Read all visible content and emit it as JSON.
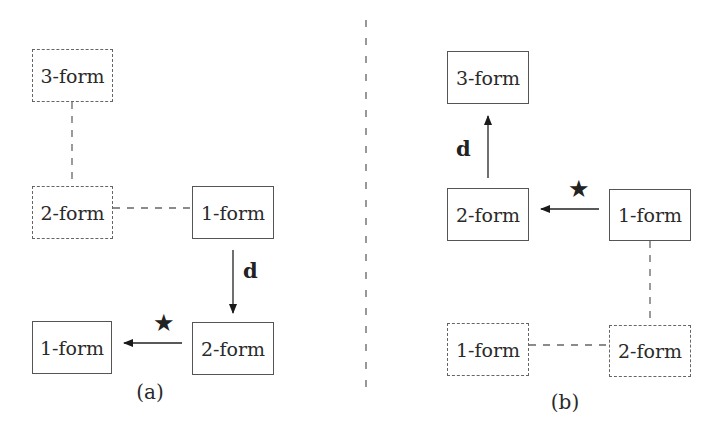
{
  "diagram": {
    "panels": [
      {
        "id": "a",
        "caption": "(a)",
        "nodes": [
          {
            "id": "a_3form",
            "label": "3-form",
            "style": "dashed"
          },
          {
            "id": "a_2form_top",
            "label": "2-form",
            "style": "dashed"
          },
          {
            "id": "a_1form_top",
            "label": "1-form",
            "style": "solid"
          },
          {
            "id": "a_2form_bottom",
            "label": "2-form",
            "style": "solid"
          },
          {
            "id": "a_1form_bottom",
            "label": "1-form",
            "style": "solid"
          }
        ],
        "edges": [
          {
            "from": "a_3form",
            "to": "a_2form_top",
            "style": "dashed",
            "label": ""
          },
          {
            "from": "a_2form_top",
            "to": "a_1form_top",
            "style": "dashed",
            "label": ""
          },
          {
            "from": "a_1form_top",
            "to": "a_2form_bottom",
            "style": "arrow",
            "label": "d"
          },
          {
            "from": "a_2form_bottom",
            "to": "a_1form_bottom",
            "style": "arrow",
            "label": "★"
          }
        ]
      },
      {
        "id": "b",
        "caption": "(b)",
        "nodes": [
          {
            "id": "b_3form",
            "label": "3-form",
            "style": "solid"
          },
          {
            "id": "b_2form_top",
            "label": "2-form",
            "style": "solid"
          },
          {
            "id": "b_1form_top",
            "label": "1-form",
            "style": "solid"
          },
          {
            "id": "b_1form_bottom",
            "label": "1-form",
            "style": "dashed"
          },
          {
            "id": "b_2form_bottom",
            "label": "2-form",
            "style": "dashed"
          }
        ],
        "edges": [
          {
            "from": "b_2form_top",
            "to": "b_3form",
            "style": "arrow",
            "label": "d"
          },
          {
            "from": "b_1form_top",
            "to": "b_2form_top",
            "style": "arrow",
            "label": "★"
          },
          {
            "from": "b_1form_top",
            "to": "b_2form_bottom",
            "style": "dashed",
            "label": ""
          },
          {
            "from": "b_1form_bottom",
            "to": "b_2form_bottom",
            "style": "dashed",
            "label": ""
          }
        ]
      }
    ],
    "labels": {
      "d": "d",
      "star": "★",
      "caption_a": "(a)",
      "caption_b": "(b)"
    }
  }
}
